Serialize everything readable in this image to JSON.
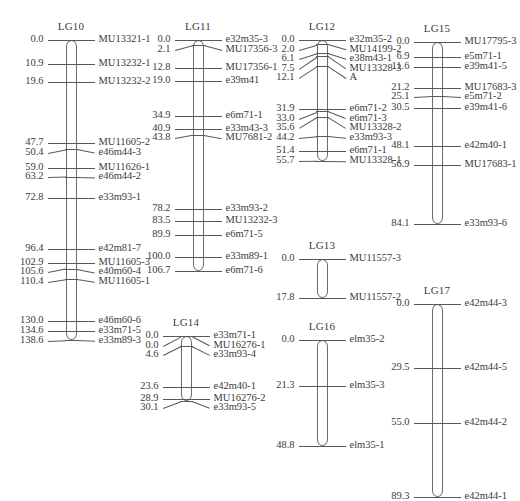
{
  "figure": {
    "kind": "genetic-linkage-map",
    "unit": "cM",
    "px_per_cm": 2.165,
    "line_color": "#585858",
    "text_color": "#3b3b3b",
    "background": "#ffffff"
  },
  "chart_data": {
    "type": "table",
    "title": "",
    "xlabel": "",
    "ylabel": "Map position (cM)",
    "groups": [
      {
        "name": "LG10",
        "x": 71,
        "top": 40,
        "length": 138.6,
        "label_side_pos": "left",
        "label_side_marker": "right",
        "loci": [
          {
            "pos": "0.0",
            "cm": 0.0,
            "marker": "MU13321-1"
          },
          {
            "pos": "10.9",
            "cm": 10.9,
            "marker": "MU13232-1"
          },
          {
            "pos": "19.6",
            "cm": 19.6,
            "marker": "MU13232-2"
          },
          {
            "pos": "47.7",
            "cm": 47.7,
            "marker": "MU11605-2"
          },
          {
            "pos": "50.4",
            "cm": 50.4,
            "marker": "e46m44-3"
          },
          {
            "pos": "59.0",
            "cm": 59.0,
            "marker": "MU11626-1"
          },
          {
            "pos": "63.2",
            "cm": 63.2,
            "marker": "e46m44-2"
          },
          {
            "pos": "72.8",
            "cm": 72.8,
            "marker": "e33m93-1"
          },
          {
            "pos": "96.4",
            "cm": 96.4,
            "marker": "e42m81-7"
          },
          {
            "pos": "102.9",
            "cm": 102.9,
            "marker": "MU11605-3"
          },
          {
            "pos": "105.6",
            "cm": 105.6,
            "marker": "e40m60-4"
          },
          {
            "pos": "110.4",
            "cm": 110.4,
            "marker": "MU11605-1"
          },
          {
            "pos": "130.0",
            "cm": 130.0,
            "marker": "e46m60-6"
          },
          {
            "pos": "134.6",
            "cm": 134.6,
            "marker": "e33m71-5"
          },
          {
            "pos": "138.6",
            "cm": 138.6,
            "marker": "e33m89-3"
          }
        ]
      },
      {
        "name": "LG11",
        "x": 198,
        "top": 40,
        "length": 106.7,
        "label_side_pos": "left",
        "label_side_marker": "right",
        "loci": [
          {
            "pos": "0.0",
            "cm": 0.0,
            "marker": "e32m35-3"
          },
          {
            "pos": "2.1",
            "cm": 2.1,
            "marker": "MU17356-3"
          },
          {
            "pos": "12.8",
            "cm": 12.8,
            "marker": "MU17356-1"
          },
          {
            "pos": "19.0",
            "cm": 19.0,
            "marker": "e39m41"
          },
          {
            "pos": "34.9",
            "cm": 34.9,
            "marker": "e6m71-1"
          },
          {
            "pos": "40.9",
            "cm": 40.9,
            "marker": "e33m43-3"
          },
          {
            "pos": "43.8",
            "cm": 43.8,
            "marker": "MU7681-2"
          },
          {
            "pos": "78.2",
            "cm": 78.2,
            "marker": "e33m93-2"
          },
          {
            "pos": "83.5",
            "cm": 83.5,
            "marker": "MU13232-3"
          },
          {
            "pos": "89.9",
            "cm": 89.9,
            "marker": "e6m71-5"
          },
          {
            "pos": "100.0",
            "cm": 100.0,
            "marker": "e33m89-1"
          },
          {
            "pos": "106.7",
            "cm": 106.7,
            "marker": "e6m71-6"
          }
        ]
      },
      {
        "name": "LG12",
        "x": 322,
        "top": 40,
        "length": 55.7,
        "label_side_pos": "left",
        "label_side_marker": "right",
        "loci": [
          {
            "pos": "0.0",
            "cm": 0.0,
            "marker": "e32m35-2"
          },
          {
            "pos": "2.0",
            "cm": 2.0,
            "marker": "MU14199-2"
          },
          {
            "pos": "6.1",
            "cm": 6.1,
            "marker": "e38m43-1"
          },
          {
            "pos": "7.5",
            "cm": 7.5,
            "marker": "MU13328-3"
          },
          {
            "pos": "12.1",
            "cm": 12.1,
            "marker": "A"
          },
          {
            "pos": "31.9",
            "cm": 31.9,
            "marker": "e6m71-2"
          },
          {
            "pos": "33.0",
            "cm": 33.0,
            "marker": "e6m71-3"
          },
          {
            "pos": "35.6",
            "cm": 35.6,
            "marker": "MU13328-2"
          },
          {
            "pos": "44.2",
            "cm": 44.2,
            "marker": "e33m93-3"
          },
          {
            "pos": "51.4",
            "cm": 51.4,
            "marker": "e6m71-1"
          },
          {
            "pos": "55.7",
            "cm": 55.7,
            "marker": "MU13328-1"
          }
        ]
      },
      {
        "name": "LG15",
        "x": 437,
        "top": 42,
        "length": 84.1,
        "label_side_pos": "left",
        "label_side_marker": "right",
        "loci": [
          {
            "pos": "0.0",
            "cm": 0.0,
            "marker": "MU17795-3"
          },
          {
            "pos": "6.9",
            "cm": 6.9,
            "marker": "e5m71-1"
          },
          {
            "pos": "11.6",
            "cm": 11.6,
            "marker": "e39m41-5"
          },
          {
            "pos": "21.2",
            "cm": 21.2,
            "marker": "MU17683-3"
          },
          {
            "pos": "25.1",
            "cm": 25.1,
            "marker": "e5m71-2"
          },
          {
            "pos": "30.5",
            "cm": 30.5,
            "marker": "e39m41-6"
          },
          {
            "pos": "48.1",
            "cm": 48.1,
            "marker": "e42m40-1"
          },
          {
            "pos": "56.9",
            "cm": 56.9,
            "marker": "MU17683-1"
          },
          {
            "pos": "84.1",
            "cm": 84.1,
            "marker": "e33m93-6"
          }
        ]
      },
      {
        "name": "LG13",
        "x": 322,
        "top": 259,
        "length": 17.8,
        "label_side_pos": "left",
        "label_side_marker": "right",
        "loci": [
          {
            "pos": "0.0",
            "cm": 0.0,
            "marker": "MU11557-3"
          },
          {
            "pos": "17.8",
            "cm": 17.8,
            "marker": "MU11557-2"
          }
        ]
      },
      {
        "name": "LG16",
        "x": 322,
        "top": 340,
        "length": 48.8,
        "label_side_pos": "left",
        "label_side_marker": "right",
        "loci": [
          {
            "pos": "0.0",
            "cm": 0.0,
            "marker": "elm35-2"
          },
          {
            "pos": "21.3",
            "cm": 21.3,
            "marker": "elm35-3"
          },
          {
            "pos": "48.8",
            "cm": 48.8,
            "marker": "elm35-1"
          }
        ]
      },
      {
        "name": "LG14",
        "x": 186,
        "top": 336,
        "length": 30.1,
        "label_side_pos": "left",
        "label_side_marker": "right",
        "loci": [
          {
            "pos": "0.0",
            "cm": 0.0,
            "marker": "e33m71-1"
          },
          {
            "pos": "0.0",
            "cm": 0.0,
            "marker": "MU16276-1"
          },
          {
            "pos": "4.6",
            "cm": 4.6,
            "marker": "e33m93-4"
          },
          {
            "pos": "23.6",
            "cm": 23.6,
            "marker": "e42m40-1"
          },
          {
            "pos": "28.9",
            "cm": 28.9,
            "marker": "MU16276-2"
          },
          {
            "pos": "30.1",
            "cm": 30.1,
            "marker": "e33m93-5"
          }
        ]
      },
      {
        "name": "LG17",
        "x": 437,
        "top": 304,
        "length": 89.3,
        "label_side_pos": "left",
        "label_side_marker": "right",
        "loci": [
          {
            "pos": "0.0",
            "cm": 0.0,
            "marker": "e42m44-3"
          },
          {
            "pos": "29.5",
            "cm": 29.5,
            "marker": "e42m44-5"
          },
          {
            "pos": "55.0",
            "cm": 55.0,
            "marker": "e42m44-2"
          },
          {
            "pos": "89.3",
            "cm": 89.3,
            "marker": "e42m44-1"
          }
        ]
      }
    ]
  }
}
